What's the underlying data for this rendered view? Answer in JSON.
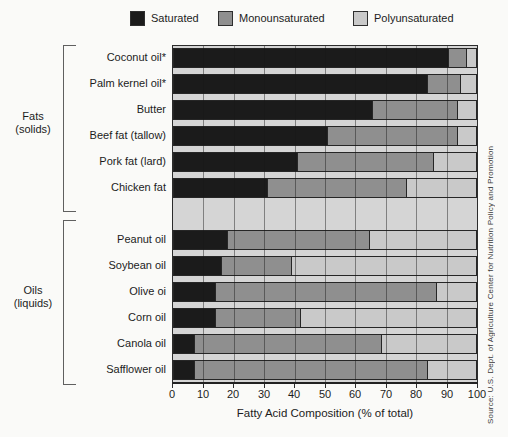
{
  "legend": {
    "items": [
      {
        "label": "Saturated",
        "color": "#1b1b1b"
      },
      {
        "label": "Monounsaturated",
        "color": "#8f8f8f"
      },
      {
        "label": "Polyunsaturated",
        "color": "#c9c9c9"
      }
    ]
  },
  "chart_data": {
    "type": "bar",
    "orientation": "horizontal-stacked",
    "title": "",
    "xlabel": "Fatty Acid Composition (% of total)",
    "ylabel": "",
    "xlim": [
      0,
      100
    ],
    "x_ticks": [
      0,
      10,
      20,
      30,
      40,
      50,
      60,
      70,
      80,
      90,
      100
    ],
    "grid": "vertical gridlines every 10",
    "legend_position": "top",
    "series_names": [
      "Saturated",
      "Monounsaturated",
      "Polyunsaturated"
    ],
    "groups": [
      {
        "label": "Fats",
        "sublabel": "(solids)",
        "items": [
          {
            "name": "Coconut oil*",
            "values": [
              91,
              6,
              3
            ]
          },
          {
            "name": "Palm kernel oil*",
            "values": [
              84,
              11,
              5
            ]
          },
          {
            "name": "Butter",
            "values": [
              66,
              28,
              6
            ]
          },
          {
            "name": "Beef fat (tallow)",
            "values": [
              51,
              43,
              6
            ]
          },
          {
            "name": "Pork fat (lard)",
            "values": [
              41,
              45,
              14
            ]
          },
          {
            "name": "Chicken fat",
            "values": [
              31,
              46,
              23
            ]
          }
        ]
      },
      {
        "label": "Oils",
        "sublabel": "(liquids)",
        "items": [
          {
            "name": "Peanut oil",
            "values": [
              18,
              47,
              35
            ]
          },
          {
            "name": "Soybean oil",
            "values": [
              16,
              23,
              61
            ]
          },
          {
            "name": "Olive oi",
            "values": [
              14,
              73,
              13
            ]
          },
          {
            "name": "Corn oil",
            "values": [
              14,
              28,
              58
            ]
          },
          {
            "name": "Canola oil",
            "values": [
              7,
              62,
              31
            ]
          },
          {
            "name": "Safflower oil",
            "values": [
              7,
              77,
              16
            ]
          }
        ]
      }
    ]
  },
  "source": "Source: U.S. Dept. of Agriculture Center for Nutrition Policy and Promotion",
  "colors": {
    "saturated": "#1b1b1b",
    "monounsaturated": "#8f8f8f",
    "polyunsaturated": "#c9c9c9",
    "plot_background": "#d5d5d5",
    "gridline": "#3c3c3c",
    "bar_border": "#262626"
  }
}
